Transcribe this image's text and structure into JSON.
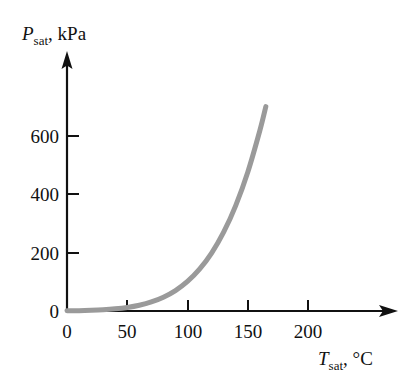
{
  "chart_data": {
    "type": "line",
    "title": "",
    "subtitle": "",
    "xlabel_var": "T",
    "xlabel_sub": "sat",
    "xlabel_unit": ", °C",
    "ylabel_var": "P",
    "ylabel_sub": "sat",
    "ylabel_unit": ", kPa",
    "xlim": [
      0,
      225
    ],
    "ylim": [
      0,
      790
    ],
    "grid": false,
    "legend": "none",
    "xticks": [
      0,
      50,
      100,
      150,
      200
    ],
    "xtick_labels": [
      "0",
      "50",
      "100",
      "150",
      "200"
    ],
    "yticks": [
      0,
      200,
      400,
      600
    ],
    "ytick_labels": [
      "0",
      "200",
      "400",
      "600"
    ],
    "series": [
      {
        "name": "Saturation pressure of water",
        "color": "#9a9a9a",
        "line_width": 5,
        "x": [
          0,
          10,
          20,
          30,
          40,
          50,
          60,
          70,
          80,
          90,
          100,
          110,
          120,
          130,
          140,
          150,
          160,
          165
        ],
        "y": [
          0.6,
          1.2,
          2.3,
          4.2,
          7.4,
          12.3,
          19.9,
          31.2,
          47.4,
          70.1,
          101.3,
          143.3,
          198.5,
          270.1,
          361.3,
          475.8,
          618.0,
          700.8
        ]
      }
    ],
    "annotations": []
  },
  "axes": {
    "x_arrow": true,
    "y_arrow": true,
    "axis_color": "#111111"
  }
}
